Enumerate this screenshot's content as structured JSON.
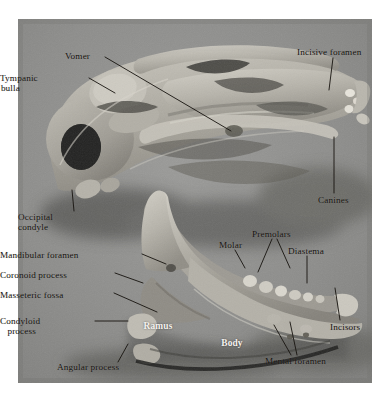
{
  "figure": {
    "kind": "anatomical-photograph",
    "plate": {
      "left": 18,
      "top": 19,
      "width": 354,
      "height": 364,
      "background_color": "#8c8c8c",
      "page_color": "#ffffff"
    },
    "label_colors": {
      "dark_text": "#16130f",
      "white_text": "#f4f2ee",
      "leader_line": "#16130f"
    }
  },
  "labels": [
    {
      "id": "vomer",
      "text": "Vomer",
      "style": "dark",
      "align": "left",
      "x": 65,
      "y": 51,
      "leader": [
        [
          105,
          57
        ],
        [
          231,
          131
        ]
      ]
    },
    {
      "id": "tympanic-bulla",
      "text": "Tympanic\nbulla",
      "style": "dark",
      "align": "right",
      "x": 20,
      "y": 73,
      "leader": [
        [
          89,
          78
        ],
        [
          115,
          93
        ]
      ]
    },
    {
      "id": "incisive-foramen",
      "text": "Incisive foramen",
      "style": "dark",
      "align": "left",
      "x": 297,
      "y": 47,
      "leader": [
        [
          333,
          58
        ],
        [
          329,
          90
        ]
      ]
    },
    {
      "id": "canines",
      "text": "Canines",
      "style": "dark",
      "align": "left",
      "x": 318,
      "y": 195,
      "leader": [
        [
          334,
          193
        ],
        [
          334,
          137
        ]
      ]
    },
    {
      "id": "occipital-condyle",
      "text": "Occipital\ncondyle",
      "style": "dark",
      "align": "left",
      "x": 18,
      "y": 212,
      "leader": [
        [
          74,
          211
        ],
        [
          72,
          190
        ]
      ]
    },
    {
      "id": "premolars",
      "text": "Premolars",
      "style": "dark",
      "align": "left",
      "x": 252,
      "y": 229,
      "leader": [
        [
          272,
          239
        ],
        [
          258,
          272
        ]
      ],
      "leader2": [
        [
          277,
          239
        ],
        [
          290,
          268
        ]
      ]
    },
    {
      "id": "molar",
      "text": "Molar",
      "style": "dark",
      "align": "left",
      "x": 219,
      "y": 240,
      "leader": [
        [
          235,
          250
        ],
        [
          245,
          268
        ]
      ]
    },
    {
      "id": "diastema",
      "text": "Diastema",
      "style": "dark",
      "align": "left",
      "x": 288,
      "y": 246,
      "leader": [
        [
          307,
          256
        ],
        [
          307,
          283
        ]
      ]
    },
    {
      "id": "mandibular-foramen",
      "text": "Mandibular foramen",
      "style": "dark",
      "align": "right",
      "x": 48,
      "y": 250,
      "leader": [
        [
          142,
          254
        ],
        [
          166,
          264
        ]
      ]
    },
    {
      "id": "coronoid-process",
      "text": "Coronoid process",
      "style": "dark",
      "align": "right",
      "x": 33,
      "y": 270,
      "leader": [
        [
          115,
          273
        ],
        [
          143,
          283
        ]
      ]
    },
    {
      "id": "masseteric-fossa",
      "text": "Masseteric fossa",
      "style": "dark",
      "align": "right",
      "x": 39,
      "y": 290,
      "leader": [
        [
          114,
          293
        ],
        [
          157,
          312
        ]
      ]
    },
    {
      "id": "condyloid-process",
      "text": "Condyloid\nprocess",
      "style": "dark",
      "align": "right",
      "x": 36,
      "y": 316,
      "leader": [
        [
          95,
          321
        ],
        [
          128,
          321
        ]
      ]
    },
    {
      "id": "incisors",
      "text": "Incisors",
      "style": "dark",
      "align": "left",
      "x": 330,
      "y": 322,
      "leader": [
        [
          340,
          320
        ],
        [
          335,
          288
        ]
      ]
    },
    {
      "id": "angular-process",
      "text": "Angular process",
      "style": "dark",
      "align": "left",
      "x": 57,
      "y": 362,
      "leader": [
        [
          118,
          362
        ],
        [
          128,
          344
        ]
      ]
    },
    {
      "id": "mental-foramen",
      "text": "Mental foramen",
      "style": "dark",
      "align": "left",
      "x": 265,
      "y": 356,
      "leader": [
        [
          291,
          355
        ],
        [
          274,
          325
        ]
      ],
      "leader2": [
        [
          297,
          355
        ],
        [
          290,
          322
        ]
      ]
    },
    {
      "id": "ramus",
      "text": "Ramus",
      "style": "white",
      "align": "center",
      "x": 158,
      "y": 321
    },
    {
      "id": "body",
      "text": "Body",
      "style": "white",
      "align": "center",
      "x": 232,
      "y": 338
    }
  ]
}
